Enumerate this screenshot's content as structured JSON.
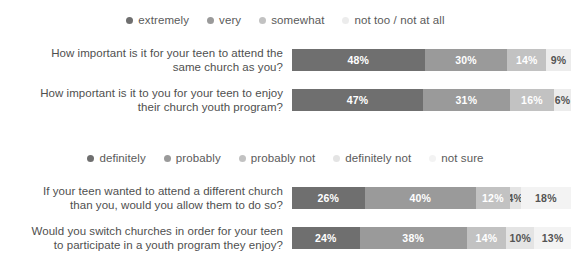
{
  "chart_data": [
    {
      "type": "bar",
      "orientation": "horizontal",
      "stacked": true,
      "stack_mode": "percent",
      "title": "",
      "xlabel": "",
      "ylabel": "",
      "xlim": [
        0,
        101
      ],
      "grid": false,
      "legend_position": "top-center",
      "legend": [
        {
          "label": "extremely",
          "color": "#6f6f6f"
        },
        {
          "label": "very",
          "color": "#9a9a9a"
        },
        {
          "label": "somewhat",
          "color": "#c2c2c2"
        },
        {
          "label": "not too / not at all",
          "color": "#ececec"
        }
      ],
      "categories": [
        "How important is it for your teen to attend the same church as you?",
        "How important is it to you for your teen to enjoy their church youth program?"
      ],
      "series": [
        {
          "name": "extremely",
          "values": [
            48,
            47
          ],
          "color": "#6f6f6f",
          "text_color": "#ffffff"
        },
        {
          "name": "very",
          "values": [
            30,
            31
          ],
          "color": "#9a9a9a",
          "text_color": "#ffffff"
        },
        {
          "name": "somewhat",
          "values": [
            14,
            16
          ],
          "color": "#c2c2c2",
          "text_color": "#ffffff"
        },
        {
          "name": "not too / not at all",
          "values": [
            9,
            6
          ],
          "color": "#ececec",
          "text_color": "#545454"
        }
      ],
      "data_labels": [
        [
          "48%",
          "30%",
          "14%",
          "9%"
        ],
        [
          "47%",
          "31%",
          "16%",
          "6%"
        ]
      ]
    },
    {
      "type": "bar",
      "orientation": "horizontal",
      "stacked": true,
      "stack_mode": "percent",
      "title": "",
      "xlabel": "",
      "ylabel": "",
      "xlim": [
        0,
        101
      ],
      "grid": false,
      "legend_position": "top-center",
      "legend": [
        {
          "label": "definitely",
          "color": "#6f6f6f"
        },
        {
          "label": "probably",
          "color": "#9a9a9a"
        },
        {
          "label": "probably not",
          "color": "#c2c2c2"
        },
        {
          "label": "definitely not",
          "color": "#e4e4e4"
        },
        {
          "label": "not sure",
          "color": "#f3f3f3"
        }
      ],
      "categories": [
        "If your teen wanted to attend a different church than you, would you allow them to do so?",
        "Would you switch churches in order for your teen to participate in a youth program they enjoy?"
      ],
      "series": [
        {
          "name": "definitely",
          "values": [
            26,
            24
          ],
          "color": "#6f6f6f",
          "text_color": "#ffffff"
        },
        {
          "name": "probably",
          "values": [
            40,
            38
          ],
          "color": "#9a9a9a",
          "text_color": "#ffffff"
        },
        {
          "name": "probably not",
          "values": [
            12,
            14
          ],
          "color": "#c2c2c2",
          "text_color": "#ffffff"
        },
        {
          "name": "definitely not",
          "values": [
            4,
            10
          ],
          "color": "#e4e4e4",
          "text_color": "#545454"
        },
        {
          "name": "not sure",
          "values": [
            18,
            13
          ],
          "color": "#f3f3f3",
          "text_color": "#545454"
        }
      ],
      "data_labels": [
        [
          "26%",
          "40%",
          "12%",
          "4%",
          "18%"
        ],
        [
          "24%",
          "38%",
          "14%",
          "10%",
          "13%"
        ]
      ]
    }
  ],
  "groups": [
    {
      "legend": [
        {
          "label": "extremely",
          "color": "#6f6f6f"
        },
        {
          "label": "very",
          "color": "#9a9a9a"
        },
        {
          "label": "somewhat",
          "color": "#c2c2c2"
        },
        {
          "label": "not too / not at all",
          "color": "#ececec"
        }
      ],
      "rows": [
        {
          "label_line1": "How important is it for your teen to attend the",
          "label_line2": "same church as you?",
          "segments": [
            {
              "name": "extremely",
              "value": 48,
              "label": "48%",
              "color": "#6f6f6f",
              "text_color": "#ffffff"
            },
            {
              "name": "very",
              "value": 30,
              "label": "30%",
              "color": "#9a9a9a",
              "text_color": "#ffffff"
            },
            {
              "name": "somewhat",
              "value": 14,
              "label": "14%",
              "color": "#c2c2c2",
              "text_color": "#ffffff"
            },
            {
              "name": "not too / not at all",
              "value": 9,
              "label": "9%",
              "color": "#ececec",
              "text_color": "#545454"
            }
          ]
        },
        {
          "label_line1": "How important is it to you for your teen to enjoy",
          "label_line2": "their church youth program?",
          "segments": [
            {
              "name": "extremely",
              "value": 47,
              "label": "47%",
              "color": "#6f6f6f",
              "text_color": "#ffffff"
            },
            {
              "name": "very",
              "value": 31,
              "label": "31%",
              "color": "#9a9a9a",
              "text_color": "#ffffff"
            },
            {
              "name": "somewhat",
              "value": 16,
              "label": "16%",
              "color": "#c2c2c2",
              "text_color": "#ffffff"
            },
            {
              "name": "not too / not at all",
              "value": 6,
              "label": "6%",
              "color": "#ececec",
              "text_color": "#545454"
            }
          ]
        }
      ]
    },
    {
      "legend": [
        {
          "label": "definitely",
          "color": "#6f6f6f"
        },
        {
          "label": "probably",
          "color": "#9a9a9a"
        },
        {
          "label": "probably not",
          "color": "#c2c2c2"
        },
        {
          "label": "definitely not",
          "color": "#e4e4e4"
        },
        {
          "label": "not sure",
          "color": "#f3f3f3"
        }
      ],
      "rows": [
        {
          "label_line1": "If your teen wanted to attend a different church",
          "label_line2": "than you, would you allow them to do so?",
          "segments": [
            {
              "name": "definitely",
              "value": 26,
              "label": "26%",
              "color": "#6f6f6f",
              "text_color": "#ffffff"
            },
            {
              "name": "probably",
              "value": 40,
              "label": "40%",
              "color": "#9a9a9a",
              "text_color": "#ffffff"
            },
            {
              "name": "probably not",
              "value": 12,
              "label": "12%",
              "color": "#c2c2c2",
              "text_color": "#ffffff"
            },
            {
              "name": "definitely not",
              "value": 4,
              "label": "4%",
              "color": "#e4e4e4",
              "text_color": "#545454"
            },
            {
              "name": "not sure",
              "value": 18,
              "label": "18%",
              "color": "#f3f3f3",
              "text_color": "#545454"
            }
          ]
        },
        {
          "label_line1": "Would you switch churches in order for your teen",
          "label_line2": "to participate in a youth program they enjoy?",
          "segments": [
            {
              "name": "definitely",
              "value": 24,
              "label": "24%",
              "color": "#6f6f6f",
              "text_color": "#ffffff"
            },
            {
              "name": "probably",
              "value": 38,
              "label": "38%",
              "color": "#9a9a9a",
              "text_color": "#ffffff"
            },
            {
              "name": "probably not",
              "value": 14,
              "label": "14%",
              "color": "#c2c2c2",
              "text_color": "#ffffff"
            },
            {
              "name": "definitely not",
              "value": 10,
              "label": "10%",
              "color": "#e4e4e4",
              "text_color": "#545454"
            },
            {
              "name": "not sure",
              "value": 13,
              "label": "13%",
              "color": "#f3f3f3",
              "text_color": "#545454"
            }
          ]
        }
      ]
    }
  ]
}
